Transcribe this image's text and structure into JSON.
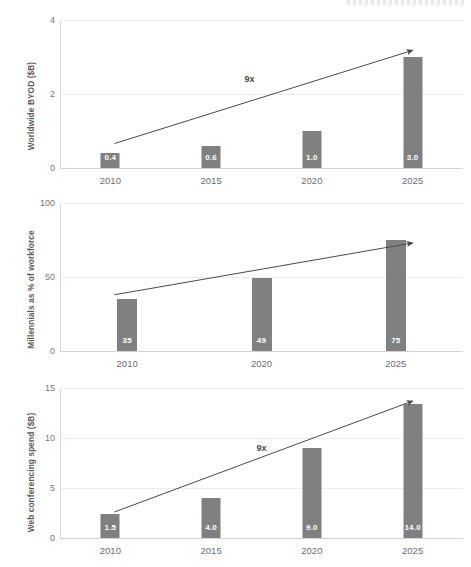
{
  "figure": {
    "background_color": "#ffffff",
    "bar_color": "#808080",
    "bar_label_color": "#ffffff",
    "axis_text_color": "#6d6d6d",
    "gridline_color": "#ececed",
    "trend_line_color": "#4a4a4a"
  },
  "chart_data": [
    {
      "type": "bar",
      "title": "",
      "xlabel": "",
      "ylabel": "Worldwide BYOD ($B)",
      "categories": [
        "2010",
        "2015",
        "2020",
        "2025"
      ],
      "values": [
        0.4,
        0.6,
        1.0,
        3.0
      ],
      "value_labels": [
        "0.4",
        "0.6",
        "1.0",
        "3.0"
      ],
      "ylim": [
        0,
        4
      ],
      "yticks": [
        0,
        2,
        4
      ],
      "ytick_labels": [
        "0",
        "2",
        "4"
      ],
      "grid": true,
      "legend": "none",
      "annotations": [
        {
          "text": "9x",
          "x_frac": 0.47,
          "y_frac": 0.4
        }
      ],
      "trend_line": {
        "start": {
          "x_frac": 0.135,
          "y_value": 0.66
        },
        "end": {
          "x_frac": 0.875,
          "y_value": 3.18
        },
        "arrow": true
      }
    },
    {
      "type": "bar",
      "title": "",
      "xlabel": "",
      "ylabel": "Millennials as % of workforce",
      "categories": [
        "2010",
        "2020",
        "2025"
      ],
      "values": [
        35,
        49,
        75
      ],
      "value_labels": [
        "35",
        "49",
        "75"
      ],
      "ylim": [
        0,
        100
      ],
      "yticks": [
        0,
        50,
        100
      ],
      "ytick_labels": [
        "0",
        "50",
        "100"
      ],
      "grid": true,
      "legend": "none",
      "annotations": [],
      "trend_line": {
        "start": {
          "x_frac": 0.135,
          "y_value": 38
        },
        "end": {
          "x_frac": 0.875,
          "y_value": 73
        },
        "arrow": true
      }
    },
    {
      "type": "bar",
      "title": "",
      "xlabel": "",
      "ylabel": "Web conferencing spend ($B)",
      "categories": [
        "2010",
        "2015",
        "2020",
        "2025"
      ],
      "values": [
        2.4,
        4.0,
        9.0,
        13.4
      ],
      "value_labels": [
        "1.5",
        "4.0",
        "9.0",
        "14.0"
      ],
      "ylim": [
        0,
        15
      ],
      "yticks": [
        0,
        5,
        10,
        15
      ],
      "ytick_labels": [
        "0",
        "5",
        "10",
        "15"
      ],
      "grid": true,
      "legend": "none",
      "annotations": [
        {
          "text": "9x",
          "x_frac": 0.5,
          "y_frac": 0.4
        }
      ],
      "trend_line": {
        "start": {
          "x_frac": 0.135,
          "y_value": 2.6
        },
        "end": {
          "x_frac": 0.875,
          "y_value": 13.7
        },
        "arrow": true
      }
    }
  ]
}
